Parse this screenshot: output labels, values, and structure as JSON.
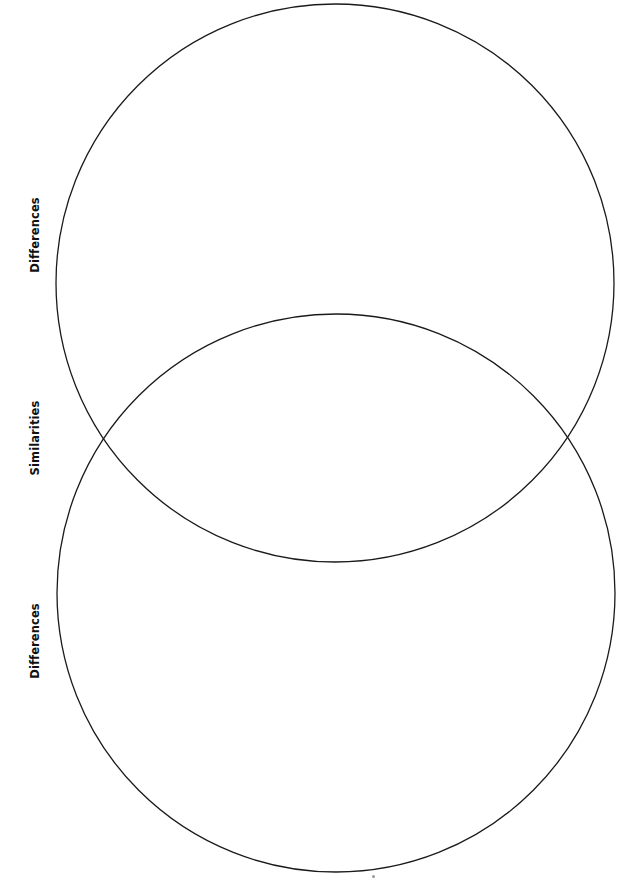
{
  "diagram": {
    "type": "venn",
    "orientation": "vertical",
    "labels": {
      "top_differences": "Differences",
      "similarities": "Similarities",
      "bottom_differences": "Differences"
    },
    "circles": [
      {
        "name": "top-circle",
        "cx": 335,
        "cy": 283,
        "r": 279
      },
      {
        "name": "bottom-circle",
        "cx": 336,
        "cy": 593,
        "r": 279
      }
    ],
    "stroke_color": "#1a1a1a"
  }
}
